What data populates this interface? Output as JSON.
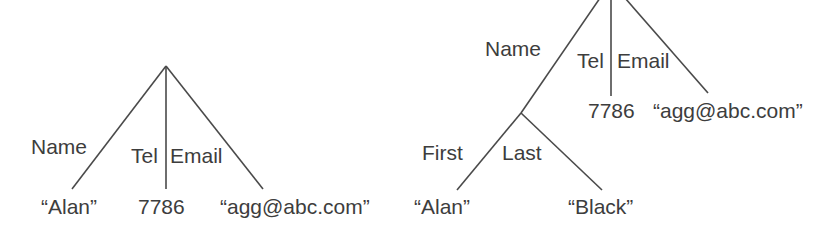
{
  "figure": {
    "type": "two-tree-diagram",
    "background_color": "#ffffff",
    "line_color": "#4a4a4a",
    "text_color": "#3d3d3d"
  },
  "trees": [
    {
      "id": "flat-record-tree",
      "name": "left-tree",
      "root_label": "",
      "edges": [
        {
          "label": "Name",
          "from": "root",
          "to": "alan"
        },
        {
          "label": "Tel",
          "from": "root",
          "to": "tel7786"
        },
        {
          "label": "Email",
          "from": "root",
          "to": "email"
        }
      ],
      "leaves": [
        {
          "id": "alan",
          "value": "“Alan”"
        },
        {
          "id": "tel7786",
          "value": "7786"
        },
        {
          "id": "email",
          "value": "“agg@abc.com”"
        }
      ]
    },
    {
      "id": "nested-record-tree",
      "name": "right-tree",
      "root_label": "",
      "edges": [
        {
          "label": "Name",
          "from": "root",
          "to": "name-node"
        },
        {
          "label": "Tel",
          "from": "root",
          "to": "tel7786"
        },
        {
          "label": "Email",
          "from": "root",
          "to": "email"
        },
        {
          "label": "First",
          "from": "name-node",
          "to": "alan"
        },
        {
          "label": "Last",
          "from": "name-node",
          "to": "black"
        }
      ],
      "leaves": [
        {
          "id": "alan",
          "value": "“Alan”"
        },
        {
          "id": "black",
          "value": "“Black”"
        },
        {
          "id": "tel7786",
          "value": "7786"
        },
        {
          "id": "email",
          "value": "“agg@abc.com”"
        }
      ]
    }
  ],
  "labels": {
    "left": {
      "name": "Name",
      "tel": "Tel",
      "email": "Email",
      "leaf_alan": "“Alan”",
      "leaf_tel": "7786",
      "leaf_email": "“agg@abc.com”"
    },
    "right": {
      "name": "Name",
      "tel": "Tel",
      "email": "Email",
      "first": "First",
      "last": "Last",
      "leaf_tel": "7786",
      "leaf_email": "“agg@abc.com”",
      "leaf_alan": "“Alan”",
      "leaf_black": "“Black”"
    }
  }
}
